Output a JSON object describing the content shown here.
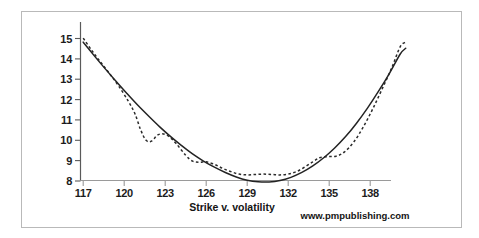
{
  "figure": {
    "background_color": "#ffffff",
    "frame_color": "#b9b9b9",
    "axis_color": "#5a5a5a",
    "text_color": "#141414"
  },
  "axis_title": "Strike v. volatility",
  "watermark": "www.pmpublishing.com",
  "y_ticks": [
    "15",
    "14",
    "13",
    "12",
    "11",
    "10",
    "9",
    "8"
  ],
  "x_ticks": [
    "117",
    "120",
    "123",
    "126",
    "129",
    "132",
    "135",
    "138"
  ],
  "chart_data": {
    "type": "line",
    "title": "",
    "subtitle": "",
    "xlabel": "Strike v. volatility",
    "ylabel": "",
    "xlim": [
      116.3,
      140.8
    ],
    "ylim": [
      7.7,
      15.55
    ],
    "grid": false,
    "legend_position": "none",
    "annotations": [
      "www.pmpublishing.com"
    ],
    "x_tick_values": [
      117,
      120,
      123,
      126,
      129,
      132,
      135,
      138
    ],
    "y_tick_values": [
      8,
      9,
      10,
      11,
      12,
      13,
      14,
      15
    ],
    "series": [
      {
        "name": "fitted smile (solid)",
        "style": "solid",
        "color": "#232323",
        "width": 1.5,
        "x": [
          117.0,
          117.8,
          118.6,
          119.4,
          120.2,
          121.0,
          121.8,
          122.6,
          123.4,
          124.2,
          125.0,
          125.8,
          126.6,
          127.4,
          128.2,
          129.0,
          129.8,
          130.6,
          131.4,
          132.2,
          133.0,
          133.8,
          134.6,
          135.4,
          136.2,
          137.0,
          137.8,
          138.6,
          139.4,
          140.2,
          140.6
        ],
        "y": [
          14.82,
          14.16,
          13.52,
          12.9,
          12.3,
          11.72,
          11.18,
          10.66,
          10.18,
          9.74,
          9.33,
          8.98,
          8.68,
          8.42,
          8.2,
          8.04,
          7.96,
          7.95,
          8.02,
          8.18,
          8.42,
          8.74,
          9.14,
          9.62,
          10.18,
          10.84,
          11.58,
          12.4,
          13.28,
          14.24,
          14.52
        ]
      },
      {
        "name": "market quotes (dashed)",
        "style": "dashed",
        "color": "#2b2b2b",
        "width": 1.5,
        "x": [
          117.0,
          117.6,
          118.2,
          118.9,
          119.6,
          120.3,
          120.8,
          121.2,
          121.6,
          122.0,
          122.5,
          123.1,
          123.8,
          124.5,
          125.0,
          125.5,
          126.0,
          126.6,
          127.2,
          127.8,
          128.4,
          129.0,
          129.6,
          130.2,
          130.8,
          131.4,
          132.0,
          132.6,
          133.2,
          133.8,
          134.3,
          134.9,
          135.5,
          136.1,
          136.8,
          137.5,
          138.2,
          138.9,
          139.6,
          140.2,
          140.6
        ],
        "y": [
          15.02,
          14.44,
          13.9,
          13.3,
          12.66,
          11.92,
          11.28,
          10.52,
          10.0,
          9.96,
          10.28,
          10.26,
          9.84,
          9.26,
          8.98,
          8.92,
          8.94,
          8.82,
          8.62,
          8.46,
          8.34,
          8.3,
          8.32,
          8.34,
          8.32,
          8.3,
          8.34,
          8.46,
          8.68,
          8.94,
          9.14,
          9.2,
          9.22,
          9.42,
          9.92,
          10.66,
          11.56,
          12.56,
          13.6,
          14.6,
          14.82
        ]
      }
    ]
  }
}
